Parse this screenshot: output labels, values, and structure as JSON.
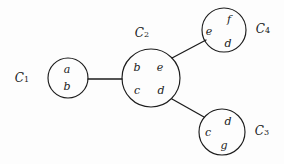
{
  "diagram": {
    "type": "cluster-tree-graph",
    "background_color": "#fdfdfd",
    "stroke_color": "#1c1c1c",
    "clusters": [
      {
        "id": "C1",
        "label_base": "C",
        "label_sub": "1",
        "label_x": 22,
        "label_y": 78,
        "cx": 68,
        "cy": 78,
        "r": 20,
        "letters": [
          {
            "text": "a",
            "x": 67,
            "y": 70
          },
          {
            "text": "b",
            "x": 67,
            "y": 87
          }
        ]
      },
      {
        "id": "C2",
        "label_base": "C",
        "label_sub": "2",
        "label_x": 142,
        "label_y": 33,
        "cx": 151,
        "cy": 78,
        "r": 29,
        "letters": [
          {
            "text": "b",
            "x": 137,
            "y": 68
          },
          {
            "text": "e",
            "x": 160,
            "y": 68
          },
          {
            "text": "c",
            "x": 137,
            "y": 91
          },
          {
            "text": "d",
            "x": 161,
            "y": 91
          }
        ]
      },
      {
        "id": "C3",
        "label_base": "C",
        "label_sub": "3",
        "label_x": 262,
        "label_y": 131,
        "cx": 222,
        "cy": 132,
        "r": 23,
        "letters": [
          {
            "text": "d",
            "x": 228,
            "y": 122
          },
          {
            "text": "c",
            "x": 208,
            "y": 133
          },
          {
            "text": "g",
            "x": 224,
            "y": 146
          }
        ]
      },
      {
        "id": "C4",
        "label_base": "C",
        "label_sub": "4",
        "label_x": 263,
        "label_y": 29,
        "cx": 224,
        "cy": 30,
        "r": 22,
        "letters": [
          {
            "text": "f",
            "x": 229,
            "y": 20
          },
          {
            "text": "e",
            "x": 209,
            "y": 32
          },
          {
            "text": "d",
            "x": 228,
            "y": 44
          }
        ]
      }
    ],
    "edges": [
      {
        "id": "edge-c1-c2",
        "from": "C1",
        "to": "C2",
        "x1": 88,
        "y1": 79,
        "x2": 122,
        "y2": 79
      },
      {
        "id": "edge-c2-c4",
        "from": "C2",
        "to": "C4",
        "x1": 172,
        "y1": 58,
        "x2": 206,
        "y2": 40
      },
      {
        "id": "edge-c2-c3",
        "from": "C2",
        "to": "C3",
        "x1": 172,
        "y1": 99,
        "x2": 204,
        "y2": 117
      }
    ]
  }
}
